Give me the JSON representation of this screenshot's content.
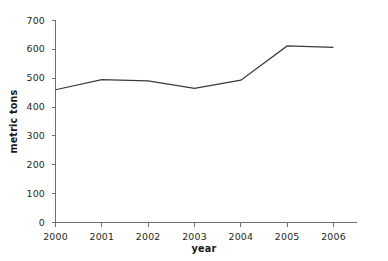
{
  "chart_data": {
    "type": "line",
    "title": "",
    "subtitle": "",
    "xlabel": "year",
    "ylabel": "metric tons",
    "categories": [
      "2000",
      "2001",
      "2002",
      "2003",
      "2004",
      "2005",
      "2006"
    ],
    "x": [
      2000,
      2001,
      2002,
      2003,
      2004,
      2005,
      2006
    ],
    "values": [
      460,
      495,
      491,
      465,
      493,
      612,
      607
    ],
    "series": [
      {
        "name": "metric tons",
        "values": [
          460,
          495,
          491,
          465,
          493,
          612,
          607
        ]
      }
    ],
    "xlim": [
      2000,
      2006
    ],
    "ylim": [
      0,
      700
    ],
    "yticks": [
      0,
      100,
      200,
      300,
      400,
      500,
      600,
      700
    ],
    "ytick_labels": [
      "0",
      "100",
      "200",
      "300",
      "400",
      "500",
      "600",
      "700"
    ],
    "xticks": [
      2000,
      2001,
      2002,
      2003,
      2004,
      2005,
      2006
    ],
    "xtick_labels": [
      "2000",
      "2001",
      "2002",
      "2003",
      "2004",
      "2005",
      "2006"
    ],
    "grid": false,
    "legend": false,
    "legend_position": "none",
    "line_color": "#3a3a3c",
    "axis_color": "#6f7072",
    "background_color": "#ffffff",
    "markers": false,
    "annotations": []
  }
}
